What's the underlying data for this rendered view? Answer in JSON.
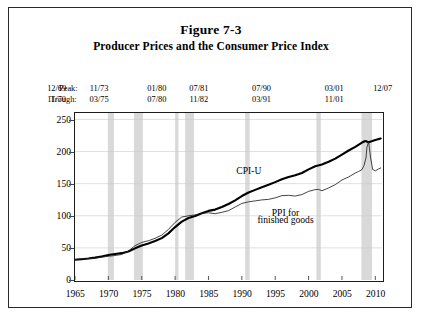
{
  "figure": {
    "number": "Figure 7-3",
    "subtitle": "Producer Prices and the Consumer Price Index"
  },
  "peak_trough": {
    "peak_label": "Peak:",
    "trough_label": "Trough:",
    "entries": [
      {
        "peak": "12/69",
        "trough": "11/70",
        "x_pct": 11.8
      },
      {
        "peak": "11/73",
        "trough": "03/75",
        "x_pct": 22.3
      },
      {
        "peak": "01/80",
        "trough": "07/80",
        "x_pct": 36.6
      },
      {
        "peak": "07/81",
        "trough": "11/82",
        "x_pct": 47.0
      },
      {
        "peak": "07/90",
        "trough": "03/91",
        "x_pct": 62.5
      },
      {
        "peak": "03/01",
        "trough": "11/01",
        "x_pct": 80.5
      },
      {
        "peak": "12/07",
        "trough": "",
        "x_pct": 92.5
      }
    ]
  },
  "chart_data": {
    "type": "line",
    "title": "Producer Prices and the Consumer Price Index",
    "xlabel": "",
    "ylabel": "Index (1982 =100)",
    "xlim": [
      1965,
      2011
    ],
    "ylim": [
      0,
      260
    ],
    "yticks": [
      0,
      50,
      100,
      150,
      200,
      250
    ],
    "xticks": [
      1965,
      1970,
      1975,
      1980,
      1985,
      1990,
      1995,
      2000,
      2005,
      2010
    ],
    "grid": true,
    "legend": "inline-annotations",
    "annotations": [
      {
        "text": "CPI-U",
        "x": 1991.0,
        "y": 168
      },
      {
        "text": "PPI for",
        "x": 1996.5,
        "y": 104
      },
      {
        "text": "finished goods",
        "x": 1996.5,
        "y": 92
      }
    ],
    "recession_bands": [
      {
        "start": 1969.92,
        "end": 1970.83
      },
      {
        "start": 1973.83,
        "end": 1975.17
      },
      {
        "start": 1980.0,
        "end": 1980.5
      },
      {
        "start": 1981.5,
        "end": 1982.83
      },
      {
        "start": 1990.5,
        "end": 1991.17
      },
      {
        "start": 2001.17,
        "end": 2001.83
      },
      {
        "start": 2007.92,
        "end": 2009.5
      }
    ],
    "series": [
      {
        "name": "CPI-U",
        "color": "#000000",
        "width": 2.1,
        "x": [
          1965,
          1966,
          1967,
          1968,
          1969,
          1970,
          1971,
          1972,
          1973,
          1974,
          1975,
          1976,
          1977,
          1978,
          1979,
          1980,
          1981,
          1982,
          1983,
          1984,
          1985,
          1986,
          1987,
          1988,
          1989,
          1990,
          1991,
          1992,
          1993,
          1994,
          1995,
          1996,
          1997,
          1998,
          1999,
          2000,
          2001,
          2002,
          2003,
          2004,
          2005,
          2006,
          2007,
          2008.0,
          2008.5,
          2009,
          2010,
          2010.8
        ],
        "values": [
          31.5,
          32.4,
          33.4,
          34.8,
          36.7,
          38.8,
          40.5,
          41.8,
          44.4,
          49.3,
          53.8,
          56.9,
          60.6,
          65.2,
          72.6,
          82.4,
          90.9,
          96.5,
          99.6,
          103.9,
          107.6,
          109.6,
          113.6,
          118.3,
          124.0,
          130.7,
          136.2,
          140.3,
          144.5,
          148.2,
          152.4,
          156.9,
          160.5,
          163.0,
          166.6,
          172.2,
          177.1,
          179.9,
          184.0,
          188.9,
          195.3,
          201.6,
          207.3,
          214.0,
          216.5,
          214.5,
          218.1,
          220.3
        ]
      },
      {
        "name": "PPI for finished goods",
        "color": "#222222",
        "width": 0.85,
        "x": [
          1965,
          1966,
          1967,
          1968,
          1969,
          1970,
          1971,
          1972,
          1973,
          1974,
          1975,
          1975.5,
          1976,
          1977,
          1978,
          1979,
          1980,
          1981,
          1982,
          1983,
          1984,
          1985,
          1986,
          1987,
          1988,
          1989,
          1990,
          1991,
          1992,
          1993,
          1994,
          1995,
          1996,
          1997,
          1998,
          1999,
          2000,
          2001,
          2001.5,
          2002,
          2003,
          2004,
          2005,
          2006,
          2007,
          2007.5,
          2008.0,
          2008.3,
          2008.6,
          2008.75,
          2009.0,
          2009.3,
          2009.6,
          2010,
          2010.5,
          2010.8
        ],
        "values": [
          31.9,
          32.9,
          33.3,
          34.2,
          35.6,
          36.9,
          38.1,
          39.8,
          45.0,
          53.5,
          58.4,
          60.0,
          61.1,
          64.9,
          69.9,
          78.7,
          89.8,
          98.0,
          100.0,
          101.3,
          103.7,
          104.7,
          103.2,
          105.4,
          108.0,
          113.6,
          119.2,
          121.7,
          123.2,
          124.7,
          125.5,
          127.9,
          131.3,
          131.8,
          130.7,
          133.0,
          138.0,
          140.7,
          141.0,
          138.9,
          143.3,
          148.5,
          155.7,
          160.4,
          166.6,
          169.0,
          172.0,
          178.0,
          190.0,
          207.0,
          215.0,
          190.0,
          172.0,
          170.0,
          173.0,
          174.5
        ]
      }
    ]
  }
}
